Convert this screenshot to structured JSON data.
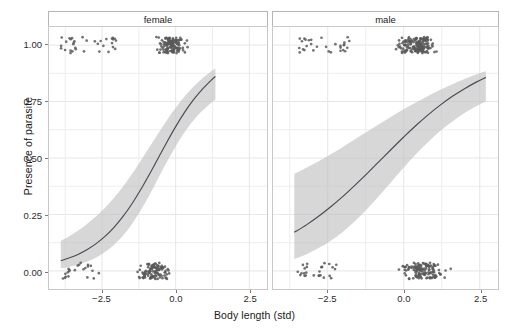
{
  "axes": {
    "y_label": "Presence of parasite",
    "x_label": "Body length (std)",
    "y_ticks": [
      "0.00",
      "0.25",
      "0.50",
      "0.75",
      "1.00"
    ],
    "x_ticks": [
      "-2.5",
      "0.0",
      "2.5"
    ]
  },
  "panels": [
    {
      "label": "female"
    },
    {
      "label": "male"
    }
  ],
  "chart_data": {
    "type": "line",
    "title": "",
    "subtitle": "",
    "xlabel": "Body length (std)",
    "ylabel": "Presence of parasite",
    "xlim": [
      -4.3,
      3.1
    ],
    "ylim": [
      -0.08,
      1.08
    ],
    "grid": true,
    "legend": "none",
    "facet_variable": "sex",
    "y_tick_values": [
      0.0,
      0.25,
      0.5,
      0.75,
      1.0
    ],
    "x_tick_values": [
      -2.5,
      0.0,
      2.5
    ],
    "facets": [
      {
        "name": "female",
        "fit": {
          "x": [
            -3.9,
            -3.6,
            -3.3,
            -3.0,
            -2.7,
            -2.4,
            -2.1,
            -1.8,
            -1.5,
            -1.2,
            -0.9,
            -0.6,
            -0.3,
            0.0,
            0.3,
            0.6,
            0.9,
            1.2,
            1.35
          ],
          "y": [
            0.045,
            0.058,
            0.074,
            0.095,
            0.121,
            0.153,
            0.192,
            0.239,
            0.294,
            0.357,
            0.426,
            0.498,
            0.57,
            0.639,
            0.702,
            0.757,
            0.804,
            0.844,
            0.861
          ],
          "ci_low": [
            0.012,
            0.019,
            0.029,
            0.042,
            0.06,
            0.084,
            0.115,
            0.155,
            0.205,
            0.265,
            0.334,
            0.408,
            0.482,
            0.552,
            0.614,
            0.666,
            0.709,
            0.744,
            0.758
          ],
          "ci_high": [
            0.133,
            0.155,
            0.18,
            0.209,
            0.242,
            0.28,
            0.323,
            0.372,
            0.426,
            0.485,
            0.546,
            0.607,
            0.667,
            0.722,
            0.772,
            0.815,
            0.852,
            0.883,
            0.896
          ]
        },
        "points_y1_count": 168,
        "points_y0_count": 132,
        "points_x_range": [
          -3.95,
          1.45
        ]
      },
      {
        "name": "male",
        "fit": {
          "x": [
            -3.6,
            -3.2,
            -2.8,
            -2.4,
            -2.0,
            -1.6,
            -1.2,
            -0.8,
            -0.4,
            0.0,
            0.4,
            0.8,
            1.2,
            1.6,
            2.0,
            2.4,
            2.7
          ],
          "y": [
            0.171,
            0.204,
            0.242,
            0.284,
            0.33,
            0.38,
            0.432,
            0.486,
            0.54,
            0.593,
            0.644,
            0.691,
            0.734,
            0.773,
            0.807,
            0.837,
            0.857
          ],
          "ci_low": [
            0.052,
            0.074,
            0.101,
            0.134,
            0.174,
            0.221,
            0.275,
            0.334,
            0.396,
            0.458,
            0.517,
            0.571,
            0.62,
            0.662,
            0.699,
            0.73,
            0.75
          ],
          "ci_high": [
            0.43,
            0.457,
            0.486,
            0.517,
            0.549,
            0.583,
            0.617,
            0.651,
            0.684,
            0.716,
            0.746,
            0.775,
            0.802,
            0.827,
            0.85,
            0.871,
            0.884
          ]
        },
        "points_y1_count": 196,
        "points_y0_count": 158,
        "points_x_range": [
          -3.6,
          2.8
        ]
      }
    ],
    "colors": {
      "line": "#4a4a55",
      "ribbon": "#bfbfbf",
      "point": "#595959",
      "panel_background": "#ffffff",
      "grid": "#ececec",
      "panel_border": "#c9c9c9",
      "strip_background": "#ffffff",
      "text": "#1a1a1a"
    }
  }
}
